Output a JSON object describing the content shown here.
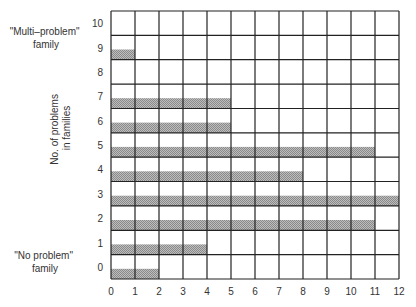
{
  "chart_data": {
    "type": "bar",
    "orientation": "horizontal",
    "title": "",
    "xlabel": "",
    "ylabel": "No. of problems in families",
    "categories": [
      "0",
      "1",
      "2",
      "3",
      "4",
      "5",
      "6",
      "7",
      "8",
      "9",
      "10"
    ],
    "values": [
      2,
      4,
      11,
      12,
      8,
      11,
      5,
      5,
      0,
      1,
      0
    ],
    "xlim": [
      0,
      12
    ],
    "x_ticks": [
      "0",
      "1",
      "2",
      "3",
      "4",
      "5",
      "6",
      "7",
      "8",
      "9",
      "10",
      "11",
      "12"
    ],
    "ylim": [
      0,
      10
    ],
    "grid": true,
    "annotations": [
      {
        "text": "\"Multi–problem\"",
        "text2": "family",
        "at_category": "9"
      },
      {
        "text": "\"No problem\"",
        "text2": "family",
        "at_category": "0"
      }
    ],
    "bar_color": "#a8a8a8",
    "grid_color": "#222222"
  },
  "labels": {
    "ylabel_line1": "No. of problems",
    "ylabel_line2": "in families",
    "multi_line1": "\"Multi–problem\"",
    "multi_line2": "family",
    "none_line1": "\"No problem\"",
    "none_line2": "family"
  }
}
